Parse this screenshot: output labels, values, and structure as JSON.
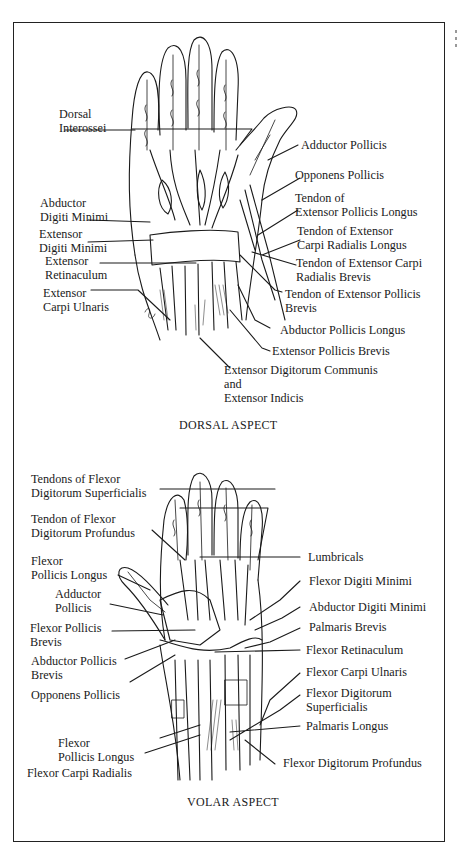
{
  "figure": {
    "dorsal": {
      "caption": "DORSAL ASPECT",
      "labels_left": [
        {
          "id": "dorsal-interossei",
          "lines": [
            "Dorsal",
            "Interossei"
          ]
        },
        {
          "id": "abductor-digiti-minimi",
          "lines": [
            "Abductor",
            "Digiti Minimi"
          ]
        },
        {
          "id": "extensor-digiti-minimi",
          "lines": [
            "Extensor",
            "Digiti Minimi"
          ]
        },
        {
          "id": "extensor-retinaculum",
          "lines": [
            "Extensor",
            "Retinaculum"
          ]
        },
        {
          "id": "extensor-carpi-ulnaris",
          "lines": [
            "Extensor",
            "Carpi Ulnaris"
          ]
        }
      ],
      "labels_right": [
        {
          "id": "adductor-pollicis",
          "lines": [
            "Adductor Pollicis"
          ]
        },
        {
          "id": "opponens-pollicis",
          "lines": [
            "Opponens Pollicis"
          ]
        },
        {
          "id": "tendon-epl",
          "lines": [
            "Tendon of",
            "Extensor Pollicis Longus"
          ]
        },
        {
          "id": "tendon-ecrl",
          "lines": [
            "Tendon of Extensor",
            "Carpi Radialis Longus"
          ]
        },
        {
          "id": "tendon-ecrb",
          "lines": [
            "Tendon of Extensor Carpi",
            "Radialis Brevis"
          ]
        },
        {
          "id": "tendon-epb",
          "lines": [
            "Tendon of Extensor Pollicis",
            "Brevis"
          ]
        },
        {
          "id": "abductor-pollicis-longus",
          "lines": [
            "Abductor Pollicis Longus"
          ]
        },
        {
          "id": "extensor-pollicis-brevis",
          "lines": [
            "Extensor Pollicis Brevis"
          ]
        },
        {
          "id": "edc-ei",
          "lines": [
            "Extensor Digitorum Communis",
            "and",
            "Extensor Indicis"
          ]
        }
      ]
    },
    "volar": {
      "caption": "VOLAR ASPECT",
      "labels_left": [
        {
          "id": "tendons-fds",
          "lines": [
            "Tendons of Flexor",
            "Digitorum Superficialis"
          ]
        },
        {
          "id": "tendon-fdp",
          "lines": [
            "Tendon of Flexor",
            "Digitorum Profundus"
          ]
        },
        {
          "id": "fpl-upper",
          "lines": [
            "Flexor",
            "Pollicis Longus"
          ]
        },
        {
          "id": "adductor-pollicis",
          "lines": [
            "Adductor",
            "Pollicis"
          ]
        },
        {
          "id": "flexor-pollicis-brevis",
          "lines": [
            "Flexor Pollicis",
            "Brevis"
          ]
        },
        {
          "id": "abductor-pollicis-brevis",
          "lines": [
            "Abductor Pollicis",
            "Brevis"
          ]
        },
        {
          "id": "opponens-pollicis",
          "lines": [
            "Opponens Pollicis"
          ]
        },
        {
          "id": "fpl-lower",
          "lines": [
            "Flexor",
            "Pollicis Longus"
          ]
        },
        {
          "id": "flexor-carpi-radialis",
          "lines": [
            "Flexor Carpi Radialis"
          ]
        }
      ],
      "labels_right": [
        {
          "id": "lumbricals",
          "lines": [
            "Lumbricals"
          ]
        },
        {
          "id": "flexor-digiti-minimi",
          "lines": [
            "Flexor Digiti Minimi"
          ]
        },
        {
          "id": "abductor-digiti-minimi",
          "lines": [
            "Abductor Digiti Minimi"
          ]
        },
        {
          "id": "palmaris-brevis",
          "lines": [
            "Palmaris Brevis"
          ]
        },
        {
          "id": "flexor-retinaculum",
          "lines": [
            "Flexor Retinaculum"
          ]
        },
        {
          "id": "flexor-carpi-ulnaris",
          "lines": [
            "Flexor Carpi Ulnaris"
          ]
        },
        {
          "id": "fds",
          "lines": [
            "Flexor Digitorum",
            "Superficialis"
          ]
        },
        {
          "id": "palmaris-longus",
          "lines": [
            "Palmaris Longus"
          ]
        },
        {
          "id": "fdp",
          "lines": [
            "Flexor Digitorum Profundus"
          ]
        }
      ]
    },
    "colors": {
      "ink": "#1a1a1a",
      "paper": "#ffffff",
      "frame": "#222222"
    }
  }
}
